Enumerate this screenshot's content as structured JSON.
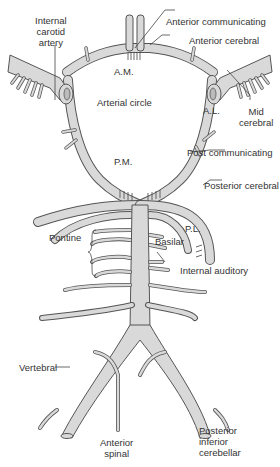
{
  "diagram": {
    "colors": {
      "vessel_fill": "#d9d9d9",
      "vessel_outline": "#555555",
      "text": "#333333",
      "background": "#ffffff"
    },
    "labels": {
      "internal_carotid": [
        "Internal",
        "carotid",
        "artery"
      ],
      "anterior_communicating": "Anterior communicating",
      "anterior_cerebral": "Anterior cerebral",
      "am": "A.M.",
      "arterial_circle": "Arterial circle",
      "al": "A.L.",
      "mid_cerebral": [
        "Mid",
        "cerebral"
      ],
      "pm": "P.M.",
      "post_communicating": "Post communicating",
      "posterior_cerebral": "Posterior cerebral",
      "pl": "P.L.",
      "pontine": "Pontine",
      "basilar": "Basilar",
      "internal_auditory": "Internal auditory",
      "vertebral": "Vertebral",
      "anterior_spinal": [
        "Anterior",
        "spinal"
      ],
      "posterior_inferior_cerebellar": [
        "Posterior",
        "inferior",
        "cerebellar"
      ]
    }
  }
}
